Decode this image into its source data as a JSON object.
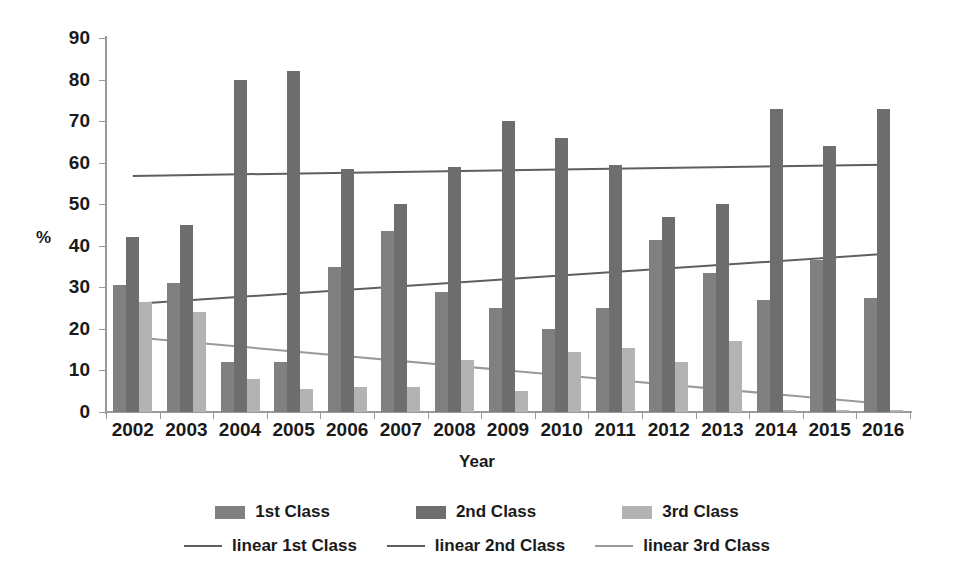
{
  "chart_data": {
    "type": "bar",
    "title": "",
    "subtitle": "",
    "xlabel": "Year",
    "ylabel": "%",
    "ylim": [
      0,
      90
    ],
    "ytick_step": 10,
    "yticks": [
      0,
      10,
      20,
      30,
      40,
      50,
      60,
      70,
      80,
      90
    ],
    "grid": false,
    "legend_position": "bottom",
    "categories": [
      "2002",
      "2003",
      "2004",
      "2005",
      "2006",
      "2007",
      "2008",
      "2009",
      "2010",
      "2011",
      "2012",
      "2013",
      "2014",
      "2015",
      "2016"
    ],
    "series": [
      {
        "name": "1st Class",
        "kind": "bar",
        "color": "#808080",
        "values": [
          30.5,
          31.0,
          12.0,
          12.0,
          35.0,
          43.5,
          29.0,
          25.0,
          20.0,
          25.0,
          41.5,
          33.5,
          27.0,
          36.5,
          27.5
        ]
      },
      {
        "name": "2nd Class",
        "kind": "bar",
        "color": "#6e6e6e",
        "values": [
          42.0,
          45.0,
          79.8,
          82.0,
          58.5,
          50.0,
          59.0,
          70.0,
          66.0,
          59.5,
          47.0,
          50.0,
          73.0,
          64.0,
          73.0
        ]
      },
      {
        "name": "3rd Class",
        "kind": "bar",
        "color": "#b3b3b3",
        "values": [
          26.5,
          24.0,
          8.0,
          5.5,
          6.0,
          6.0,
          12.5,
          5.0,
          14.5,
          15.5,
          12.0,
          17.0,
          0.6,
          0.6,
          0.6
        ]
      },
      {
        "name": "linear 1st Class",
        "kind": "trendline",
        "color": "#5f5f5f",
        "start_value": 26.0,
        "end_value": 38.0
      },
      {
        "name": "linear 2nd Class",
        "kind": "trendline",
        "color": "#5f5f5f",
        "start_value": 56.8,
        "end_value": 59.5
      },
      {
        "name": "linear 3rd Class",
        "kind": "trendline",
        "color": "#9a9a9a",
        "start_value": 18.0,
        "end_value": 2.0
      }
    ]
  },
  "legend": {
    "bar_entries": [
      {
        "label": "1st Class",
        "color": "#808080"
      },
      {
        "label": "2nd Class",
        "color": "#6e6e6e"
      },
      {
        "label": "3rd Class",
        "color": "#b3b3b3"
      }
    ],
    "line_entries": [
      {
        "label": "linear 1st Class",
        "color": "#5f5f5f"
      },
      {
        "label": "linear 2nd Class",
        "color": "#5f5f5f"
      },
      {
        "label": "linear 3rd Class",
        "color": "#9a9a9a"
      }
    ]
  },
  "axes": {
    "y_title": "%",
    "x_title": "Year"
  }
}
